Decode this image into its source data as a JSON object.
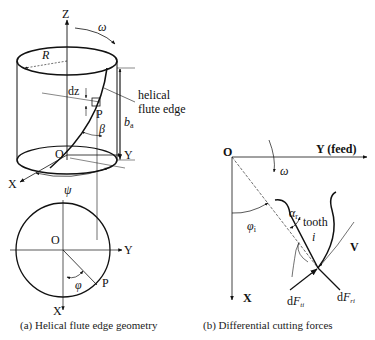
{
  "panel_a": {
    "caption": "(a) Helical flute edge geometry",
    "labels": {
      "z_axis": "Z",
      "omega": "ω",
      "radius": "R",
      "dz": "dz",
      "helical_flute_edge_line1": "helical",
      "helical_flute_edge_line2": "flute edge",
      "point_p": "P",
      "ba": "b",
      "ba_sub": "a",
      "beta": "β",
      "origin": "O",
      "y_axis": "Y",
      "x_axis": "X",
      "psi": "ψ",
      "bottom_origin": "O",
      "bottom_y_axis": "Y",
      "bottom_x_axis": "X",
      "bottom_point_p": "P",
      "phi": "φ"
    }
  },
  "panel_b": {
    "caption": "(b) Differential cutting forces",
    "labels": {
      "origin": "O",
      "y_axis": "Y (feed)",
      "omega": "ω",
      "phi_i": "φ",
      "phi_i_sub": "i",
      "alpha_r": "α",
      "alpha_r_sub": "r",
      "tooth": "tooth",
      "tooth_i": "i",
      "velocity": "V",
      "x_axis": "X",
      "dF_ti_prefix": "d",
      "dF_ti": "F",
      "dF_ti_sub": "ti",
      "dF_ri_prefix": "d",
      "dF_ri": "F",
      "dF_ri_sub": "ri"
    }
  }
}
